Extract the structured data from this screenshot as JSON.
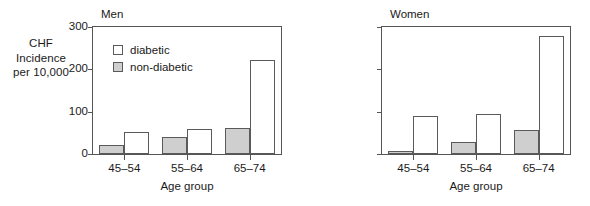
{
  "chart_data": {
    "type": "bar",
    "title": "",
    "xlabel": "Age group",
    "ylabel": "CHF Incidence per 10,000",
    "ylabel_lines": [
      "CHF",
      "Incidence",
      "per 10,000"
    ],
    "categories": [
      "45–54",
      "55–64",
      "65–74"
    ],
    "ylim": [
      0,
      300
    ],
    "yticks": [
      0,
      100,
      200,
      300
    ],
    "ytick_labels": [
      "0",
      "100",
      "200",
      "300"
    ],
    "grid": false,
    "legend_position": "inside-top-left",
    "legend": [
      "diabetic",
      "non-diabetic"
    ],
    "panels": [
      {
        "title": "Men",
        "show_ytick_labels": true,
        "series": [
          {
            "name": "non-diabetic",
            "values": [
              21,
              40,
              62
            ],
            "color": "#cfcfcf"
          },
          {
            "name": "diabetic",
            "values": [
              51,
              60,
              222
            ],
            "color": "#ffffff"
          }
        ]
      },
      {
        "title": "Women",
        "show_ytick_labels": false,
        "series": [
          {
            "name": "non-diabetic",
            "values": [
              7,
              28,
              56
            ],
            "color": "#cfcfcf"
          },
          {
            "name": "diabetic",
            "values": [
              90,
              94,
              278
            ],
            "color": "#ffffff"
          }
        ]
      }
    ]
  },
  "colors": {
    "diabetic": "#ffffff",
    "non_diabetic": "#cfcfcf",
    "axis": "#555555",
    "text": "#1a1a1a",
    "background": "#ffffff"
  }
}
